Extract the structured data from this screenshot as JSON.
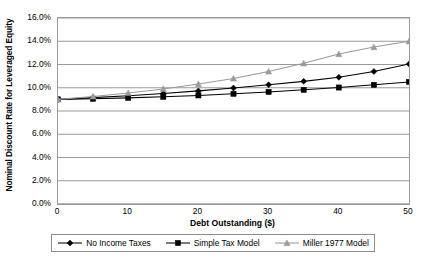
{
  "chart_data": {
    "type": "line",
    "title": "",
    "xlabel": "Debt Outstanding ($)",
    "ylabel": "Nominal Discount Rate for Leveraged Equity",
    "xlim": [
      0,
      50
    ],
    "ylim": [
      0,
      0.16
    ],
    "grid": true,
    "legend_position": "bottom",
    "x": [
      0,
      5,
      10,
      15,
      20,
      25,
      30,
      35,
      40,
      45,
      50
    ],
    "x_tick_labels": [
      "0",
      "10",
      "20",
      "30",
      "40",
      "50"
    ],
    "x_ticks": [
      0,
      10,
      20,
      30,
      40,
      50
    ],
    "y_ticks": [
      0.0,
      0.02,
      0.04,
      0.06,
      0.08,
      0.1,
      0.12,
      0.14,
      0.16
    ],
    "y_tick_labels": [
      "0.0%",
      "2.0%",
      "4.0%",
      "6.0%",
      "8.0%",
      "10.0%",
      "12.0%",
      "14.0%",
      "16.0%"
    ],
    "series": [
      {
        "name": "No Income Taxes",
        "marker": "diamond",
        "color": "#000000",
        "values": [
          0.09,
          0.0915,
          0.0932,
          0.0951,
          0.0973,
          0.0998,
          0.1025,
          0.1055,
          0.109,
          0.114,
          0.1205
        ]
      },
      {
        "name": "Simple Tax Model",
        "marker": "square",
        "color": "#000000",
        "values": [
          0.09,
          0.0905,
          0.0913,
          0.0922,
          0.0934,
          0.0948,
          0.0964,
          0.0982,
          0.1002,
          0.1025,
          0.105
        ]
      },
      {
        "name": "Miller 1977 Model",
        "marker": "triangle",
        "color": "#9a9a9a",
        "values": [
          0.09,
          0.0925,
          0.0955,
          0.099,
          0.1032,
          0.108,
          0.114,
          0.121,
          0.129,
          0.135,
          0.14
        ]
      }
    ]
  },
  "legend": {
    "entries": [
      {
        "label": "No Income Taxes"
      },
      {
        "label": "Simple Tax Model"
      },
      {
        "label": "Miller 1977 Model"
      }
    ]
  },
  "axes": {
    "x_title": "Debt Outstanding ($)",
    "y_title": "Nominal Discount Rate for Leveraged Equity"
  }
}
